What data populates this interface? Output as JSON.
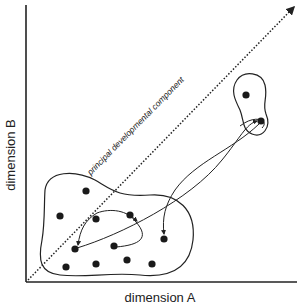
{
  "figure": {
    "y_axis_label": "dimension B",
    "x_axis_label": "dimension A",
    "diagonal_label": "principal developmental component",
    "colors": {
      "ink": "#222222",
      "background": "#ffffff"
    }
  },
  "clusters": [
    {
      "name": "lower-cluster",
      "points": [
        [
          86,
          191
        ],
        [
          60,
          216
        ],
        [
          96,
          219
        ],
        [
          130,
          215
        ],
        [
          75,
          249
        ],
        [
          114,
          246
        ],
        [
          66,
          267
        ],
        [
          96,
          264
        ],
        [
          127,
          260
        ],
        [
          152,
          264
        ],
        [
          164,
          239
        ]
      ]
    },
    {
      "name": "upper-cluster",
      "points": [
        [
          246,
          95
        ],
        [
          261,
          121
        ]
      ]
    }
  ]
}
